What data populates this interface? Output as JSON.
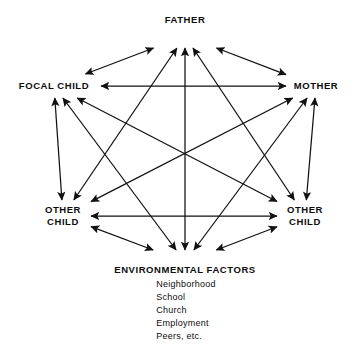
{
  "diagram": {
    "type": "node-link",
    "stroke_color": "#111111",
    "text_color": "#0d0d0d",
    "background_color": "#ffffff",
    "nodes": [
      {
        "id": "father",
        "label": "FATHER",
        "x": 185,
        "y": 20
      },
      {
        "id": "focal_child",
        "label": "FOCAL CHILD",
        "x": 54,
        "y": 86
      },
      {
        "id": "mother",
        "label": "MOTHER",
        "x": 316,
        "y": 86
      },
      {
        "id": "other_child_left",
        "label_line1": "OTHER",
        "label_line2": "CHILD",
        "x": 63,
        "y": 216
      },
      {
        "id": "other_child_right",
        "label_line1": "OTHER",
        "label_line2": "CHILD",
        "x": 305,
        "y": 216
      },
      {
        "id": "environment",
        "label": "ENVIRONMENTAL FACTORS",
        "x": 185,
        "y": 270
      }
    ],
    "environment_items": [
      "Neighborhood",
      "School",
      "Church",
      "Employment",
      "Peers, etc."
    ],
    "edges": [
      {
        "from": "focal_child",
        "to": "father",
        "bidirectional": true
      },
      {
        "from": "mother",
        "to": "father",
        "bidirectional": true
      },
      {
        "from": "other_child_left",
        "to": "father",
        "bidirectional": true
      },
      {
        "from": "other_child_right",
        "to": "father",
        "bidirectional": true
      },
      {
        "from": "environment",
        "to": "father",
        "bidirectional": true
      },
      {
        "from": "focal_child",
        "to": "mother",
        "bidirectional": true
      },
      {
        "from": "focal_child",
        "to": "other_child_left",
        "bidirectional": true
      },
      {
        "from": "focal_child",
        "to": "other_child_right",
        "bidirectional": true
      },
      {
        "from": "focal_child",
        "to": "environment",
        "bidirectional": true
      },
      {
        "from": "mother",
        "to": "other_child_left",
        "bidirectional": true
      },
      {
        "from": "mother",
        "to": "other_child_right",
        "bidirectional": true
      },
      {
        "from": "mother",
        "to": "environment",
        "bidirectional": true
      },
      {
        "from": "other_child_left",
        "to": "other_child_right",
        "bidirectional": true
      },
      {
        "from": "other_child_left",
        "to": "environment",
        "bidirectional": true
      },
      {
        "from": "other_child_right",
        "to": "environment",
        "bidirectional": true
      }
    ]
  }
}
